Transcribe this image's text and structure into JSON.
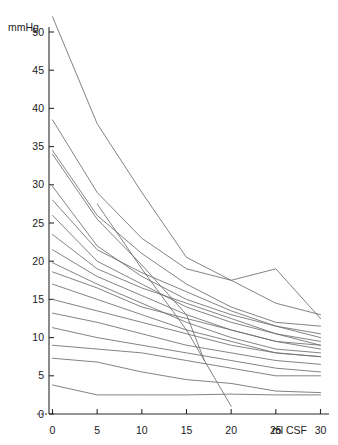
{
  "chart_data": {
    "type": "line",
    "title": "",
    "subtitle": "",
    "xlabel": "ml CSF",
    "ylabel": "mmHg",
    "xlim": [
      0,
      30
    ],
    "ylim": [
      0,
      52
    ],
    "grid": false,
    "legend": "none",
    "x_ticks": [
      0,
      5,
      10,
      15,
      20,
      25,
      30
    ],
    "x_tick_labels": [
      "0",
      "5",
      "10",
      "15",
      "20",
      "25",
      "30"
    ],
    "y_ticks": [
      0,
      5,
      10,
      15,
      20,
      25,
      30,
      35,
      40,
      45,
      50
    ],
    "y_tick_labels": [
      "0",
      "5",
      "10",
      "15",
      "20",
      "25",
      "30",
      "35",
      "40",
      "45",
      "50"
    ],
    "x_axis_unit_text": "ml CSF",
    "series_count": 17,
    "series": [
      {
        "name": "patient-01",
        "x": [
          0,
          5,
          10,
          15,
          20,
          25,
          30
        ],
        "y": [
          52.0,
          38.0,
          29.0,
          20.5,
          17.5,
          14.5,
          13.0
        ]
      },
      {
        "name": "patient-02",
        "x": [
          0,
          5,
          10,
          15,
          20,
          25,
          30
        ],
        "y": [
          38.5,
          29.0,
          23.0,
          19.0,
          17.5,
          19.0,
          12.5
        ]
      },
      {
        "name": "patient-03",
        "x": [
          0,
          5,
          10,
          15,
          20,
          25,
          30
        ],
        "y": [
          34.5,
          26.0,
          21.0,
          17.0,
          14.0,
          12.0,
          11.5
        ]
      },
      {
        "name": "patient-04",
        "x": [
          0,
          5,
          10,
          15,
          20,
          25,
          30
        ],
        "y": [
          29.8,
          22.0,
          18.0,
          15.0,
          13.0,
          11.5,
          10.5
        ]
      },
      {
        "name": "patient-05",
        "x": [
          0,
          5,
          10,
          15,
          20,
          25,
          30
        ],
        "y": [
          28.0,
          21.5,
          18.5,
          16.0,
          13.5,
          11.5,
          10.0
        ]
      },
      {
        "name": "patient-06",
        "x": [
          0,
          5,
          10,
          15,
          20,
          25,
          30
        ],
        "y": [
          26.0,
          20.0,
          17.0,
          14.0,
          12.0,
          10.5,
          9.5
        ]
      },
      {
        "name": "patient-07",
        "x": [
          0,
          5,
          10,
          15,
          20,
          25,
          30
        ],
        "y": [
          23.5,
          19.0,
          16.5,
          14.5,
          12.5,
          10.5,
          9.0
        ]
      },
      {
        "name": "patient-08",
        "x": [
          0,
          5,
          10,
          15,
          20,
          25,
          30
        ],
        "y": [
          21.5,
          18.0,
          15.5,
          13.0,
          11.0,
          9.5,
          8.5
        ]
      },
      {
        "name": "patient-09",
        "x": [
          0,
          5,
          10,
          15,
          20,
          25,
          30
        ],
        "y": [
          19.8,
          17.0,
          14.5,
          12.0,
          10.0,
          8.5,
          8.0
        ]
      },
      {
        "name": "patient-10",
        "x": [
          0,
          5,
          10,
          15,
          20,
          25,
          30
        ],
        "y": [
          18.6,
          16.5,
          14.0,
          12.5,
          11.0,
          9.5,
          9.0
        ]
      },
      {
        "name": "patient-11",
        "x": [
          0,
          5,
          10,
          15,
          20,
          25,
          30
        ],
        "y": [
          17.0,
          15.0,
          13.0,
          11.0,
          9.5,
          8.0,
          7.5
        ]
      },
      {
        "name": "patient-12",
        "x": [
          0,
          5,
          10,
          15,
          20,
          25,
          30
        ],
        "y": [
          15.0,
          13.5,
          12.0,
          10.5,
          9.0,
          8.0,
          7.5
        ]
      },
      {
        "name": "patient-13",
        "x": [
          0,
          5,
          10,
          15,
          20,
          25,
          30
        ],
        "y": [
          13.2,
          12.0,
          10.5,
          9.0,
          8.0,
          7.0,
          6.5
        ]
      },
      {
        "name": "patient-14",
        "x": [
          0,
          5,
          10,
          15,
          20,
          25,
          30
        ],
        "y": [
          11.3,
          10.0,
          9.0,
          8.0,
          7.0,
          6.0,
          5.5
        ]
      },
      {
        "name": "patient-15",
        "x": [
          0,
          5,
          10,
          15,
          20,
          25,
          30
        ],
        "y": [
          9.0,
          8.5,
          8.0,
          7.0,
          6.0,
          5.0,
          5.0
        ]
      },
      {
        "name": "patient-16",
        "x": [
          0,
          5,
          10,
          15,
          20,
          25,
          30
        ],
        "y": [
          7.3,
          6.8,
          5.5,
          4.5,
          4.0,
          3.0,
          2.8
        ]
      },
      {
        "name": "patient-17",
        "x": [
          0,
          5,
          10,
          15,
          20,
          25,
          30
        ],
        "y": [
          3.8,
          2.5,
          2.5,
          2.5,
          2.6,
          2.5,
          2.5
        ]
      },
      {
        "name": "patient-18-short",
        "x": [
          0,
          5,
          10,
          15,
          17
        ],
        "y": [
          34.0,
          25.5,
          19.5,
          13.0,
          7.0
        ]
      },
      {
        "name": "patient-19-steep",
        "x": [
          5,
          10,
          15,
          20
        ],
        "y": [
          27.5,
          19.0,
          11.0,
          1.0
        ]
      }
    ],
    "annotations": []
  }
}
